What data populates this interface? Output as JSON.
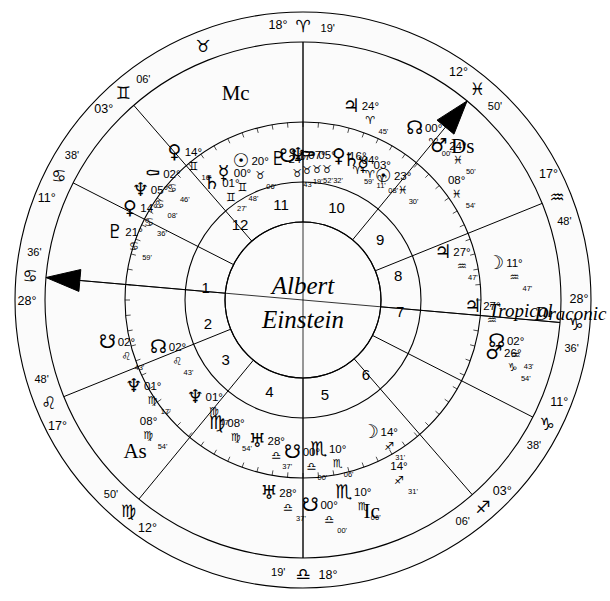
{
  "chart": {
    "title_line1": "Albert",
    "title_line2": "Einstein",
    "wheel_labels": {
      "inner": "Tropical",
      "outer": "Draconic"
    },
    "axis_labels": {
      "mc": "Mc",
      "ic": "Ic",
      "asc": "As",
      "dsc": "Ds"
    },
    "center_x": 303,
    "center_y": 300
  },
  "outer_cusps": [
    {
      "name": "mc-cusp",
      "deg": "18°",
      "sign": "♈",
      "min": "19'",
      "angle": 90,
      "sign_name": "aries"
    },
    {
      "name": "cusp-11",
      "deg": "12°",
      "sign": "♓",
      "min": "50'",
      "angle": 50.5,
      "sign_name": "pisces"
    },
    {
      "name": "cusp-12",
      "deg": "17°",
      "sign": "♒",
      "min": "48'",
      "angle": 22.0,
      "sign_name": "aquarius"
    },
    {
      "name": "dsc-cusp",
      "deg": "28°",
      "sign": "♑",
      "min": "36'",
      "angle": 355.0,
      "sign_name": "capricorn"
    },
    {
      "name": "cusp-2",
      "deg": "11°",
      "sign": "♑",
      "min": "38'",
      "angle": 333.0,
      "sign_name": "capricorn"
    },
    {
      "name": "cusp-3",
      "deg": "03°",
      "sign": "♐",
      "min": "06'",
      "angle": 311.0,
      "sign_name": "sagittarius"
    },
    {
      "name": "ic-cusp",
      "deg": "18°",
      "sign": "♎",
      "min": "19'",
      "angle": 270.0,
      "sign_name": "libra"
    },
    {
      "name": "cusp-5",
      "deg": "12°",
      "sign": "♍",
      "min": "50'",
      "angle": 230.5,
      "sign_name": "virgo"
    },
    {
      "name": "cusp-6",
      "deg": "17°",
      "sign": "♌",
      "min": "48'",
      "angle": 202.0,
      "sign_name": "leo"
    },
    {
      "name": "asc-cusp",
      "deg": "28°",
      "sign": "♋",
      "min": "36'",
      "angle": 175.0,
      "sign_name": "cancer"
    },
    {
      "name": "cusp-8",
      "deg": "11°",
      "sign": "♋",
      "min": "38'",
      "angle": 153.0,
      "sign_name": "cancer"
    },
    {
      "name": "cusp-9",
      "deg": "03°",
      "sign": "♊",
      "min": "06'",
      "angle": 131.0,
      "sign_name": "gemini"
    }
  ],
  "outer_sign_markers": [
    {
      "name": "marker-taurus",
      "glyph": "♉",
      "angle": 111.5
    }
  ],
  "draconic_planets": [
    {
      "name": "jupiter",
      "glyph": "♃",
      "deg": "24°",
      "sign": "♈",
      "min": "45'",
      "angle": 76.0,
      "r": 200,
      "sign_name": "aries"
    },
    {
      "name": "north-node",
      "glyph": "☊",
      "deg": "00°",
      "sign": "♈",
      "min": "00'",
      "angle": 57.0,
      "r": 205,
      "sign_name": "aries"
    },
    {
      "name": "mars",
      "glyph": "♂",
      "deg": "24°",
      "sign": "♓",
      "min": "50'",
      "angle": 48.5,
      "r": 205,
      "sign_name": "pisces"
    },
    {
      "name": "descendant-marker",
      "glyph": "",
      "deg": "08°",
      "sign": "♓",
      "min": "54'",
      "angle": 38.0,
      "r": 195,
      "sign_name": "pisces"
    },
    {
      "name": "moon",
      "glyph": "☽",
      "deg": "11°",
      "sign": "♒",
      "min": "47'",
      "angle": 11.0,
      "r": 196,
      "sign_name": "aquarius"
    },
    {
      "name": "north-node-2",
      "glyph": "☊",
      "deg": "02°",
      "sign": "♒",
      "min": "43'",
      "angle": 348.0,
      "r": 198,
      "sign_name": "aquarius"
    },
    {
      "name": "mars-2",
      "glyph": "♂",
      "deg": "26°",
      "sign": "♑",
      "min": "54'",
      "angle": 344.5,
      "r": 198,
      "sign_name": "capricorn"
    },
    {
      "name": "sagittarius-point",
      "glyph": "",
      "deg": "14°",
      "sign": "♐",
      "min": "31'",
      "angle": 300.0,
      "r": 192,
      "sign_name": "sagittarius"
    },
    {
      "name": "uranus",
      "glyph": "♅",
      "deg": "28°",
      "sign": "♎",
      "min": "37'",
      "angle": 260.0,
      "r": 196,
      "sign_name": "libra"
    },
    {
      "name": "scorpio-point",
      "glyph": "♏",
      "deg": "10°",
      "sign": "♏",
      "min": "06'",
      "angle": 282.0,
      "r": 196,
      "sign_name": "scorpio"
    },
    {
      "name": "south-node",
      "glyph": "☋",
      "deg": "00°",
      "sign": "♎",
      "min": "00'",
      "angle": 272.0,
      "r": 205,
      "sign_name": "libra"
    },
    {
      "name": "ascendant-marker",
      "glyph": "",
      "deg": "08°",
      "sign": "♍",
      "min": "54'",
      "angle": 218.0,
      "r": 196,
      "sign_name": "virgo"
    },
    {
      "name": "neptune",
      "glyph": "♆",
      "deg": "01°",
      "sign": "♍",
      "min": "17'",
      "angle": 207.0,
      "r": 190,
      "sign_name": "virgo"
    },
    {
      "name": "south-node-2",
      "glyph": "☋",
      "deg": "02°",
      "sign": "♌",
      "min": "43'",
      "angle": 192.0,
      "r": 200,
      "sign_name": "leo"
    },
    {
      "name": "pluto-outer",
      "glyph": "♇",
      "deg": "21°",
      "sign": "♋",
      "min": "59'",
      "angle": 160.0,
      "r": 200,
      "sign_name": "cancer"
    },
    {
      "name": "venus-outer",
      "glyph": "♀",
      "deg": "14°",
      "sign": "♋",
      "min": "36'",
      "angle": 152.0,
      "r": 196,
      "sign_name": "cancer"
    },
    {
      "name": "neptune-outer",
      "glyph": "♆",
      "deg": "05°",
      "sign": "♋",
      "min": "08'",
      "angle": 146.0,
      "r": 196,
      "sign_name": "cancer"
    },
    {
      "name": "chiron-outer",
      "glyph": "⚰",
      "deg": "02°",
      "sign": "♋",
      "min": "46'",
      "angle": 140.0,
      "r": 196,
      "sign_name": "cancer"
    },
    {
      "name": "venus-gemini",
      "glyph": "♀",
      "deg": "14°",
      "sign": "♊",
      "min": "16'",
      "angle": 131.0,
      "r": 196,
      "sign_name": "gemini"
    },
    {
      "name": "jupiter-aqu",
      "glyph": "♃",
      "deg": "27°",
      "sign": "♒",
      "min": "",
      "angle": 358.0,
      "r": 170,
      "sign_name": "aquarius"
    }
  ],
  "tropical_planets": [
    {
      "name": "sun",
      "glyph": "☉",
      "deg": "20°",
      "sign": "♉",
      "min": "06'",
      "angle": 114.0,
      "r": 152,
      "sign_name": "taurus"
    },
    {
      "name": "mercury",
      "glyph": "☿",
      "deg": "00°",
      "sign": "♊",
      "min": "48'",
      "angle": 122.0,
      "r": 150,
      "sign_name": "gemini"
    },
    {
      "name": "saturn",
      "glyph": "♄",
      "deg": "01°",
      "sign": "♊",
      "min": "27'",
      "angle": 128.0,
      "r": 148,
      "sign_name": "gemini"
    },
    {
      "name": "pluto",
      "glyph": "♇",
      "deg": "24°",
      "sign": "♉",
      "min": "43'",
      "angle": 100.0,
      "r": 143,
      "sign_name": "taurus"
    },
    {
      "name": "south-node-tr",
      "glyph": "☋",
      "deg": "17°",
      "sign": "♉",
      "min": "19'",
      "angle": 96.0,
      "r": 145,
      "sign_name": "taurus"
    },
    {
      "name": "neptune-tr",
      "glyph": "♆",
      "deg": "07°",
      "sign": "♉",
      "min": "52'",
      "angle": 92.0,
      "r": 145,
      "sign_name": "taurus"
    },
    {
      "name": "chiron-tr",
      "glyph": "⚰",
      "deg": "05°",
      "sign": "♉",
      "min": "32'",
      "angle": 88.0,
      "r": 145,
      "sign_name": "taurus"
    },
    {
      "name": "venus-tr",
      "glyph": "♀",
      "deg": "16°",
      "sign": "♈",
      "min": "59'",
      "angle": 76.0,
      "r": 148,
      "sign_name": "aries"
    },
    {
      "name": "saturn-tr",
      "glyph": "♄",
      "deg": "04°",
      "sign": "♈",
      "min": "11'",
      "angle": 71.0,
      "r": 148,
      "sign_name": "aries"
    },
    {
      "name": "mercury-tr",
      "glyph": "☿",
      "deg": "03°",
      "sign": "♈",
      "min": "08'",
      "angle": 66.0,
      "r": 148,
      "sign_name": "aries"
    },
    {
      "name": "sun-tr",
      "glyph": "☉",
      "deg": "23°",
      "sign": "♓",
      "min": "30'",
      "angle": 57.0,
      "r": 148,
      "sign_name": "pisces"
    },
    {
      "name": "jupiter-tr",
      "glyph": "♃",
      "deg": "27°",
      "sign": "♒",
      "min": "47'",
      "angle": 19.0,
      "r": 148,
      "sign_name": "aquarius"
    },
    {
      "name": "moon-tr",
      "glyph": "☽",
      "deg": "14°",
      "sign": "♐",
      "min": "31'",
      "angle": 297.0,
      "r": 148,
      "sign_name": "sagittarius"
    },
    {
      "name": "uranus-tr",
      "glyph": "♅",
      "deg": "28°",
      "sign": "♎",
      "min": "37'",
      "angle": 252.0,
      "r": 148,
      "sign_name": "libra"
    },
    {
      "name": "scorpio-tr",
      "glyph": "♏",
      "deg": "10°",
      "sign": "♏",
      "min": "06'",
      "angle": 276.0,
      "r": 150,
      "sign_name": "scorpio"
    },
    {
      "name": "libra-node-tr",
      "glyph": "☋",
      "deg": "00°",
      "sign": "♎",
      "min": "00'",
      "angle": 266.0,
      "r": 152,
      "sign_name": "libra"
    },
    {
      "name": "virgo-tr",
      "glyph": "♍",
      "deg": "08°",
      "sign": "♍",
      "min": "54'",
      "angle": 235.0,
      "r": 150,
      "sign_name": "virgo"
    },
    {
      "name": "neptune-vir",
      "glyph": "♆",
      "deg": "01°",
      "sign": "♍",
      "min": "17'",
      "angle": 222.0,
      "r": 145,
      "sign_name": "virgo"
    },
    {
      "name": "node-leo-tr",
      "glyph": "☊",
      "deg": "02°",
      "sign": "♌",
      "min": "43'",
      "angle": 198.0,
      "r": 152,
      "sign_name": "leo"
    }
  ],
  "house_numbers": [
    {
      "num": "1",
      "angle": 173.0
    },
    {
      "num": "2",
      "angle": 194.0
    },
    {
      "num": "3",
      "angle": 218.0
    },
    {
      "num": "4",
      "angle": 250.0
    },
    {
      "num": "5",
      "angle": 283.0
    },
    {
      "num": "6",
      "angle": 310.0
    },
    {
      "num": "7",
      "angle": 353.0
    },
    {
      "num": "8",
      "angle": 14.0
    },
    {
      "num": "9",
      "angle": 38.0
    },
    {
      "num": "10",
      "angle": 70.0
    },
    {
      "num": "11",
      "angle": 103.0
    },
    {
      "num": "12",
      "angle": 130.0
    }
  ],
  "house_cusp_angles": [
    175.0,
    153.0,
    131.0,
    90.0,
    50.5,
    22.0,
    355.0,
    333.0,
    311.0,
    270.0,
    230.5,
    202.0
  ]
}
